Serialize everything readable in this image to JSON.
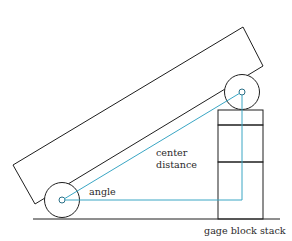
{
  "figure": {
    "labels": {
      "angle": "angle",
      "center_line1": "center",
      "center_line2": "distance",
      "gage_block_stack": "gage block stack"
    },
    "colors": {
      "outline": "#1f1f1f",
      "measurement_lines": "#3aa6c4",
      "background": "#ffffff"
    }
  }
}
